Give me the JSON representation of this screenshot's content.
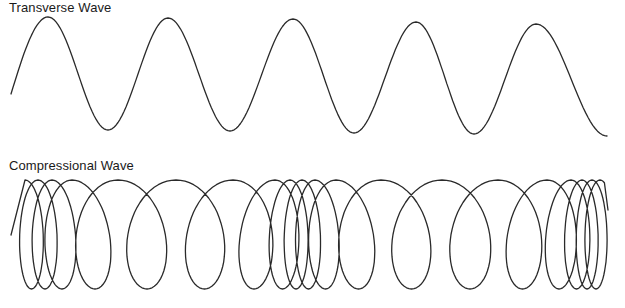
{
  "transverse": {
    "label": "Transverse Wave",
    "start": [
      11,
      94
    ],
    "peaks": [
      [
        48,
        17
      ],
      [
        168,
        18
      ],
      [
        293,
        19
      ],
      [
        416,
        22
      ],
      [
        536,
        24
      ]
    ],
    "troughs": [
      [
        108,
        130
      ],
      [
        230,
        131
      ],
      [
        354,
        133
      ],
      [
        474,
        134
      ]
    ],
    "end": [
      607,
      136
    ]
  },
  "compressional": {
    "label": "Compressional Wave",
    "y_top": 180,
    "y_bottom": 289,
    "start_x": 11,
    "loop_centers": [
      25,
      38,
      52,
      72,
      118,
      176,
      233,
      275,
      290,
      302,
      315,
      336,
      381,
      442,
      498,
      547,
      571,
      582,
      592,
      600
    ],
    "end_x": 608,
    "end_y": 210
  },
  "colors": {
    "stroke": "#2a2a2a",
    "background": "#ffffff"
  }
}
